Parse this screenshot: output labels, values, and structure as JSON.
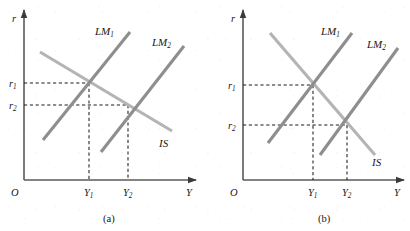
{
  "figure": {
    "width": 410,
    "height": 231,
    "background_color": "#ffffff"
  },
  "style": {
    "is_curve_color": "#b4b4b4",
    "lm_curve_color": "#8e8e8e",
    "axis_color": "#5a5a5a",
    "dash_color": "#1d1d1d",
    "text_color": "#171717",
    "curve_width": 3.1,
    "axis_width": 1.6
  },
  "panels": [
    {
      "id": "a",
      "caption": "(a)",
      "caption_pos": {
        "x": 103,
        "y": 222
      },
      "axes": {
        "origin": {
          "x": 24,
          "y": 180
        },
        "x_end": {
          "x": 196,
          "y": 180
        },
        "y_end": {
          "x": 24,
          "y": 10
        },
        "y_label": "r",
        "y_label_pos": {
          "x": 12,
          "y": 22
        },
        "x_label": "Y",
        "x_label_pos": {
          "x": 186,
          "y": 196
        },
        "origin_label": "O",
        "origin_label_pos": {
          "x": 11,
          "y": 196
        }
      },
      "curves": [
        {
          "name": "IS",
          "type": "is",
          "label": "IS",
          "label_pos": {
            "x": 159,
            "y": 147
          },
          "x1": 40,
          "y1": 52,
          "x2": 172,
          "y2": 131
        },
        {
          "name": "LM1",
          "type": "lm",
          "label": "LM",
          "sub": "1",
          "label_pos": {
            "x": 95,
            "y": 35
          },
          "x1": 43,
          "y1": 140,
          "x2": 130,
          "y2": 32
        },
        {
          "name": "LM2",
          "type": "lm",
          "label": "LM",
          "sub": "2",
          "label_pos": {
            "x": 152,
            "y": 46
          },
          "x1": 101,
          "y1": 152,
          "x2": 184,
          "y2": 46
        }
      ],
      "ticks": {
        "r1": {
          "label": "r",
          "sub": "1",
          "value_y": 83,
          "label_pos": {
            "x": 9,
            "y": 87
          }
        },
        "r2": {
          "label": "r",
          "sub": "2",
          "value_y": 105,
          "label_pos": {
            "x": 9,
            "y": 109
          }
        },
        "y1": {
          "label": "Y",
          "sub": "1",
          "value_x": 89,
          "label_pos": {
            "x": 84,
            "y": 196
          }
        },
        "y2": {
          "label": "Y",
          "sub": "2",
          "value_x": 128,
          "label_pos": {
            "x": 123,
            "y": 196
          }
        }
      },
      "equilibria": [
        {
          "name": "E1",
          "x": 89,
          "y": 83
        },
        {
          "name": "E2",
          "x": 128,
          "y": 105
        }
      ]
    },
    {
      "id": "b",
      "caption": "(b)",
      "caption_pos": {
        "x": 318,
        "y": 222
      },
      "axes": {
        "origin": {
          "x": 243,
          "y": 180
        },
        "x_end": {
          "x": 404,
          "y": 180
        },
        "y_end": {
          "x": 243,
          "y": 10
        },
        "y_label": "r",
        "y_label_pos": {
          "x": 231,
          "y": 22
        },
        "x_label": "Y",
        "x_label_pos": {
          "x": 394,
          "y": 196
        },
        "origin_label": "O",
        "origin_label_pos": {
          "x": 230,
          "y": 196
        }
      },
      "curves": [
        {
          "name": "IS",
          "type": "is",
          "label": "IS",
          "label_pos": {
            "x": 372,
            "y": 166
          },
          "x1": 270,
          "y1": 33,
          "x2": 375,
          "y2": 155
        },
        {
          "name": "LM1",
          "type": "lm",
          "label": "LM",
          "sub": "1",
          "label_pos": {
            "x": 321,
            "y": 35
          },
          "x1": 268,
          "y1": 143,
          "x2": 352,
          "y2": 33
        },
        {
          "name": "LM2",
          "type": "lm",
          "label": "LM",
          "sub": "2",
          "label_pos": {
            "x": 367,
            "y": 48
          },
          "x1": 320,
          "y1": 155,
          "x2": 398,
          "y2": 48
        }
      ],
      "ticks": {
        "r1": {
          "label": "r",
          "sub": "1",
          "value_y": 85,
          "label_pos": {
            "x": 228,
            "y": 89
          }
        },
        "r2": {
          "label": "r",
          "sub": "2",
          "value_y": 125,
          "label_pos": {
            "x": 228,
            "y": 129
          }
        },
        "y1": {
          "label": "Y",
          "sub": "1",
          "value_x": 313,
          "label_pos": {
            "x": 308,
            "y": 196
          }
        },
        "y2": {
          "label": "Y",
          "sub": "2",
          "value_x": 347,
          "label_pos": {
            "x": 342,
            "y": 196
          }
        }
      },
      "equilibria": [
        {
          "name": "E1",
          "x": 313,
          "y": 85
        },
        {
          "name": "E2",
          "x": 347,
          "y": 125
        }
      ]
    }
  ],
  "chart_data": {
    "type": "line",
    "xlabel": "Y",
    "ylabel": "r",
    "grid": false,
    "legend": null,
    "subplots": [
      {
        "label": "(a)",
        "note": "Flat (elastic) IS curve: large output change, small interest rate change",
        "series": [
          {
            "name": "IS",
            "slope_sign": "negative",
            "points": [
              [
                40,
                52
              ],
              [
                172,
                131
              ]
            ]
          },
          {
            "name": "LM1",
            "slope_sign": "positive",
            "points": [
              [
                43,
                140
              ],
              [
                130,
                32
              ]
            ]
          },
          {
            "name": "LM2",
            "slope_sign": "positive",
            "points": [
              [
                101,
                152
              ],
              [
                184,
                46
              ]
            ]
          }
        ],
        "equilibria": [
          {
            "name": "E1",
            "Y": "Y1",
            "r": "r1"
          },
          {
            "name": "E2",
            "Y": "Y2",
            "r": "r2"
          }
        ],
        "tick_labels": {
          "x": [
            "Y1",
            "Y2"
          ],
          "y": [
            "r1",
            "r2"
          ]
        }
      },
      {
        "label": "(b)",
        "note": "Steep (inelastic) IS curve: small output change, large interest rate change",
        "series": [
          {
            "name": "IS",
            "slope_sign": "negative",
            "points": [
              [
                270,
                33
              ],
              [
                375,
                155
              ]
            ]
          },
          {
            "name": "LM1",
            "slope_sign": "positive",
            "points": [
              [
                268,
                143
              ],
              [
                352,
                33
              ]
            ]
          },
          {
            "name": "LM2",
            "slope_sign": "positive",
            "points": [
              [
                320,
                155
              ],
              [
                398,
                48
              ]
            ]
          }
        ],
        "equilibria": [
          {
            "name": "E1",
            "Y": "Y1",
            "r": "r1"
          },
          {
            "name": "E2",
            "Y": "Y2",
            "r": "r2"
          }
        ],
        "tick_labels": {
          "x": [
            "Y1",
            "Y2"
          ],
          "y": [
            "r1",
            "r2"
          ]
        }
      }
    ]
  }
}
